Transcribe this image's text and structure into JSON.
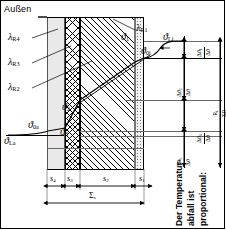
{
  "diagram": {
    "outside_label": "Außen",
    "caption_vertical": "Der Temperatur-\nabfall ist\nproportional:",
    "caption_line1": "Der Temperatur-",
    "caption_line2": "abfall ist",
    "caption_line3": "proportional:"
  },
  "lambda_labels": [
    {
      "name": "lambda-R4",
      "base": "λ",
      "sub": "R4"
    },
    {
      "name": "lambda-R3",
      "base": "λ",
      "sub": "R3"
    },
    {
      "name": "lambda-R2",
      "base": "λ",
      "sub": "R2"
    },
    {
      "name": "lambda-R1",
      "base": "λ",
      "sub": "R1"
    }
  ],
  "theta_labels": [
    {
      "name": "theta-Li",
      "base": "ϑ",
      "sub": "Li"
    },
    {
      "name": "theta-0i",
      "base": "ϑ",
      "sub": "0i"
    },
    {
      "name": "theta-1",
      "base": "ϑ",
      "sub": "1"
    },
    {
      "name": "theta-2",
      "base": "ϑ",
      "sub": "2"
    },
    {
      "name": "theta-3",
      "base": "ϑ",
      "sub": "3"
    },
    {
      "name": "theta-0a",
      "base": "ϑ",
      "sub": "0a"
    },
    {
      "name": "theta-La",
      "base": "ϑ",
      "sub": "La"
    }
  ],
  "thickness_dims": [
    {
      "name": "s4",
      "base": "s",
      "sub": "4"
    },
    {
      "name": "s3",
      "base": "s",
      "sub": "3"
    },
    {
      "name": "s2",
      "base": "s",
      "sub": "2"
    },
    {
      "name": "s1",
      "base": "s",
      "sub": "1"
    }
  ],
  "total_dim": {
    "name": "sum-s",
    "base": "Σ",
    "sub": "s"
  },
  "ratio_labels": [
    {
      "name": "ratio-Ri-1",
      "num": "Δϑ",
      "num_sub": "1",
      "den": "Δϑ"
    },
    {
      "name": "ratio-Ri-2",
      "num": "Δϑ",
      "num_sub": "2",
      "den": "Δϑ"
    },
    {
      "name": "ratio-Ri-3",
      "num": "Δϑ",
      "num_sub": "3",
      "den": "Δϑ"
    },
    {
      "name": "ratio-Ri-4",
      "num": "Δϑ",
      "num_sub": "4",
      "den": "Δϑ"
    },
    {
      "name": "ratio-R-sum",
      "num": "R",
      "num_sub": "i",
      "den": "ΣR"
    }
  ],
  "colors": {
    "ink": "#000000",
    "thin": "#6a6a6a",
    "layer_stipple": "#e9e9e9",
    "layer_plaster": "#f3f3f3",
    "background": "#ffffff"
  }
}
